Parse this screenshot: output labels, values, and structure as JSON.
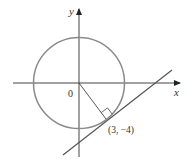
{
  "diagram": {
    "type": "circle-with-tangent-line",
    "axes": {
      "x_label": "x",
      "y_label": "y",
      "origin_label": "0"
    },
    "circle": {
      "center": "(0, 0)",
      "stroke_color": "#888888"
    },
    "tangent_point": {
      "label": "(3, −4)"
    },
    "colors": {
      "axis": "#333333",
      "circle": "#888888",
      "line": "#555555"
    }
  }
}
